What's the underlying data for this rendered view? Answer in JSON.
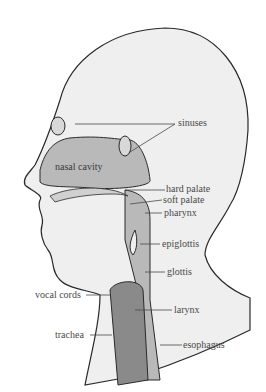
{
  "diagram": {
    "labels": [
      {
        "id": "sinuses",
        "text": "sinuses"
      },
      {
        "id": "nasal_cavity",
        "text": "nasal cavity"
      },
      {
        "id": "hard_palate",
        "text": "hard palate"
      },
      {
        "id": "soft_palate",
        "text": "soft palate"
      },
      {
        "id": "pharynx",
        "text": "pharynx"
      },
      {
        "id": "epiglottis",
        "text": "epiglottis"
      },
      {
        "id": "glottis",
        "text": "glottis"
      },
      {
        "id": "vocal_cords",
        "text": "vocal cords"
      },
      {
        "id": "larynx",
        "text": "larynx"
      },
      {
        "id": "trachea",
        "text": "trachea"
      },
      {
        "id": "esophagus",
        "text": "esophagus"
      }
    ],
    "colors": {
      "skin": "#efefef",
      "cavity": "#b9b9b9",
      "airway_dark": "#8a8a8a",
      "outline": "#2a2a2a",
      "label_text": "#4a4a4a"
    }
  }
}
